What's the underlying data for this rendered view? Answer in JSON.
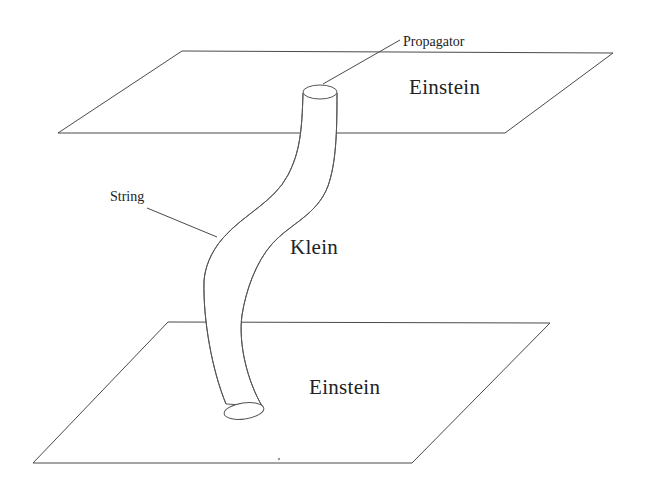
{
  "figure": {
    "background_color": "#ffffff",
    "line_color": "#4a4a4a",
    "text_color": "#222222",
    "width": 647,
    "height": 483
  },
  "labels": {
    "top_plane": "Einstein",
    "bottom_plane": "Einstein",
    "bulk_region": "Klein",
    "propagator_callout": "Propagator",
    "string_callout": "String"
  },
  "elements": {
    "top_plane_name": "top-einstein-plane",
    "bottom_plane_name": "bottom-einstein-plane",
    "tube_name": "string-worldsheet-tube",
    "top_cap_name": "tube-top-cap",
    "bottom_cap_name": "tube-bottom-cap"
  },
  "geometry": {
    "top_plane_points": "182,51 613,53 505,133 58,133",
    "bottom_plane_points": "168,322 550,323 412,463 33,463",
    "tube_left_edge": "M 303,93 C 302,130 300,152 288,175 C 274,202 244,214 223,238 C 210,253 205,268 204,281 C 203,320 212,370 226,404",
    "tube_right_edge": "M 337,93 C 337,134 336,163 328,186 C 317,215 291,223 272,244 C 256,262 246,290 242,315 C 238,345 248,382 262,406",
    "top_cap": {
      "cx": 320,
      "cy": 92,
      "rx": 17,
      "ry": 7
    },
    "bottom_cap": {
      "cx": 244,
      "cy": 411,
      "rx": 20,
      "ry": 8,
      "rotate": -8
    },
    "propagator_leader": "M 400,40 L 323,84",
    "string_leader": "M 147,208 L 217,237"
  }
}
